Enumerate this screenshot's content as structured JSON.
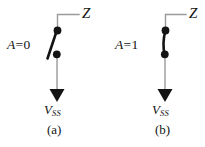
{
  "figure": {
    "colors": {
      "wire": "#9a9a9a",
      "ink": "#121212",
      "background": "#ffffff"
    },
    "panels": [
      {
        "id": "a",
        "caption": "(a)",
        "input_label": "A = 0",
        "input_symbol": "A",
        "input_equals": "=",
        "input_value": "0",
        "output_label": "Z",
        "supply_symbol": "V",
        "supply_subscript": "SS",
        "supply_label": "VSS",
        "switch_state": "open"
      },
      {
        "id": "b",
        "caption": "(b)",
        "input_label": "A = 1",
        "input_symbol": "A",
        "input_equals": "=",
        "input_value": "1",
        "output_label": "Z",
        "supply_symbol": "V",
        "supply_subscript": "SS",
        "supply_label": "VSS",
        "switch_state": "closed"
      }
    ]
  }
}
